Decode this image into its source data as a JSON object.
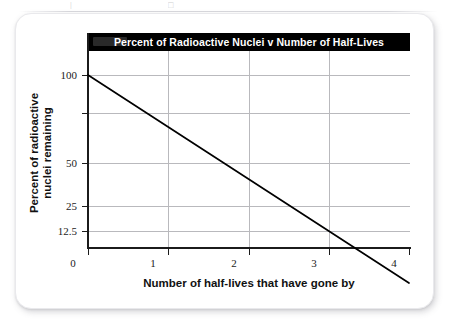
{
  "figure": {
    "card_background": "#ffffff",
    "title_bar_background": "#000000",
    "title_text_color": "#ffffff"
  },
  "chart_data": {
    "type": "line",
    "title": "Percent of Radioactive Nuclei v Number of Half-Lives",
    "xlabel": "Number of half-lives that have gone by",
    "ylabel": "Percent of radioactive nuclei remaining",
    "ylabel_line1": "Percent of radioactive",
    "ylabel_line2": "nuclei remaining",
    "x": [
      0,
      0.25,
      0.5,
      0.75,
      1,
      1.25,
      1.5,
      1.75,
      2,
      2.25,
      2.5,
      2.75,
      3,
      3.25,
      3.5,
      3.75,
      4
    ],
    "values": [
      100,
      84.09,
      70.71,
      59.46,
      50,
      42.04,
      35.36,
      29.73,
      25,
      21.02,
      17.68,
      14.87,
      12.5,
      10.51,
      8.84,
      7.43,
      6.25
    ],
    "xticks": [
      "0",
      "1",
      "2",
      "3",
      "4"
    ],
    "xtick_values": [
      0,
      1,
      2,
      3,
      4
    ],
    "yticks": [
      "100",
      "50",
      "25",
      "12.5"
    ],
    "ytick_values": [
      100,
      50,
      25,
      12.5
    ],
    "ygridline_values": [
      100,
      75,
      50,
      25,
      12.5
    ],
    "xlim": [
      0,
      4
    ],
    "ylim": [
      6.25,
      100
    ],
    "yscale": "log",
    "grid": true,
    "legend": null,
    "line_color": "#000000",
    "grid_color": "#b9b9bd",
    "axis_color": "#1b1b1b",
    "annotations": [
      "Curve halves each half-life: 100 → 50 → 25 → 12.5 → 6.25"
    ]
  },
  "artifacts": {
    "top_left_mark": "|",
    "top_mid_mark": "□"
  }
}
